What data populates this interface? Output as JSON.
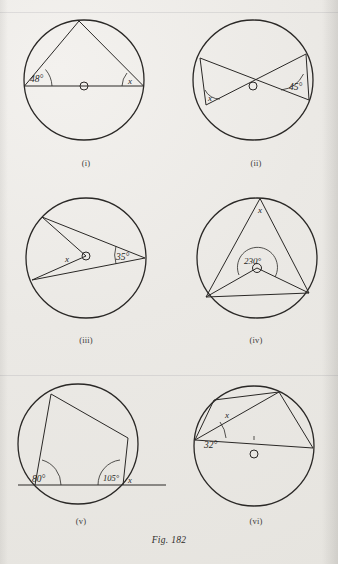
{
  "figure": {
    "caption": "Fig. 182",
    "paper_color": "#ebe9e5",
    "ink_color": "#2a2826"
  },
  "panels": [
    {
      "id": "i",
      "caption": "(i)",
      "description": "Circle with inscribed triangle on a diameter; angle 48 degrees at left end of diameter, unknown angle x at right end",
      "labels": [
        {
          "name": "angle-48",
          "text": "48°",
          "x": 46,
          "y": 96
        },
        {
          "name": "angle-x",
          "text": "x",
          "x": 131,
          "y": 92
        }
      ]
    },
    {
      "id": "ii",
      "caption": "(ii)",
      "description": "Circle with two intersecting chords forming an X and two short chords; angle 45 degrees at right, unknown angle x at left",
      "labels": [
        {
          "name": "angle-x",
          "text": "x",
          "x": 207,
          "y": 115
        },
        {
          "name": "angle-45",
          "text": "45°",
          "x": 303,
          "y": 105
        }
      ]
    },
    {
      "id": "iii",
      "caption": "(iii)",
      "description": "Circle with two chords from a right-hand point and radii to centre; angle 35 degrees at right, angle x at centre",
      "labels": [
        {
          "name": "angle-x",
          "text": "x",
          "x": 68,
          "y": 268
        },
        {
          "name": "angle-35",
          "text": "35°",
          "x": 120,
          "y": 268
        }
      ]
    },
    {
      "id": "iv",
      "caption": "(iv)",
      "description": "Circle with reflex angle 230 degrees at centre subtended by a chord, and angle x at the apex on the major arc",
      "labels": [
        {
          "name": "angle-x",
          "text": "x",
          "x": 258,
          "y": 216
        },
        {
          "name": "angle-230",
          "text": "230°",
          "x": 250,
          "y": 272
        }
      ]
    },
    {
      "id": "v",
      "caption": "(v)",
      "description": "Cyclic quadrilateral on an extended base line; interior angle 80 degrees at left, 105 degrees at right with exterior angle x",
      "labels": [
        {
          "name": "angle-80",
          "text": "80°",
          "x": 33,
          "y": 485
        },
        {
          "name": "angle-105",
          "text": "105°",
          "x": 109,
          "y": 483
        },
        {
          "name": "angle-x",
          "text": "x",
          "x": 134,
          "y": 487
        }
      ]
    },
    {
      "id": "vi",
      "caption": "(vi)",
      "description": "Circle with a quadrilateral inscribed and a diameter; angle 32 degrees at left vertex, unknown angle x on upper-left chord",
      "labels": [
        {
          "name": "angle-x",
          "text": "x",
          "x": 224,
          "y": 409
        },
        {
          "name": "angle-32",
          "text": "32°",
          "x": 210,
          "y": 445
        }
      ]
    }
  ]
}
